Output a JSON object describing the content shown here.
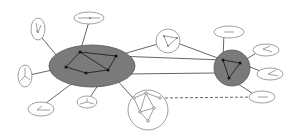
{
  "diagram": {
    "type": "hierarchical-cluster-network",
    "colors": {
      "background": "#ffffff",
      "cluster_fill": "#7a7a7a",
      "edge": "#555555",
      "node": "#111111",
      "subgraph_outline": "#888888",
      "subgraph_node": "#777777"
    },
    "clusters": [
      {
        "id": "big-cluster",
        "shape": "ellipse",
        "cx": 92,
        "cy": 67,
        "rx": 43,
        "ry": 21,
        "nodes": [
          [
            80,
            52
          ],
          [
            116,
            56
          ],
          [
            66,
            67
          ],
          [
            86,
            73
          ],
          [
            108,
            70
          ]
        ],
        "edges": [
          [
            0,
            1
          ],
          [
            0,
            2
          ],
          [
            2,
            3
          ],
          [
            3,
            4
          ],
          [
            1,
            4
          ],
          [
            0,
            4
          ]
        ]
      },
      {
        "id": "small-cluster",
        "shape": "circle",
        "cx": 232,
        "cy": 67,
        "rx": 18,
        "ry": 18,
        "nodes": [
          [
            223,
            60
          ],
          [
            240,
            63
          ],
          [
            229,
            78
          ]
        ],
        "edges": [
          [
            0,
            1
          ],
          [
            1,
            2
          ],
          [
            0,
            2
          ]
        ]
      }
    ],
    "satellites": [
      {
        "id": "sat-top-left",
        "cx": 38,
        "cy": 29,
        "rx": 7,
        "ry": 11,
        "attach": [
          80,
          52
        ]
      },
      {
        "id": "sat-top",
        "cx": 89,
        "cy": 18,
        "rx": 15,
        "ry": 6,
        "attach": [
          80,
          52
        ]
      },
      {
        "id": "sat-left",
        "cx": 25,
        "cy": 76,
        "rx": 7,
        "ry": 11,
        "attach": [
          66,
          67
        ]
      },
      {
        "id": "sat-bottom-left",
        "cx": 41,
        "cy": 109,
        "rx": 13,
        "ry": 7,
        "attach": [
          86,
          73
        ]
      },
      {
        "id": "sat-bottom",
        "cx": 87,
        "cy": 102,
        "rx": 10,
        "ry": 6,
        "attach": [
          108,
          70
        ]
      },
      {
        "id": "sat-top-center",
        "cx": 168,
        "cy": 41,
        "rx": 12,
        "ry": 12,
        "attach": null
      },
      {
        "id": "sat-right-top",
        "cx": 229,
        "cy": 32,
        "rx": 15,
        "ry": 6,
        "attach": [
          223,
          60
        ]
      },
      {
        "id": "sat-right-1",
        "cx": 266,
        "cy": 50,
        "rx": 13,
        "ry": 6,
        "attach": [
          240,
          63
        ]
      },
      {
        "id": "sat-right-2",
        "cx": 270,
        "cy": 74,
        "rx": 13,
        "ry": 6,
        "attach": [
          240,
          63
        ]
      },
      {
        "id": "sat-bottom-right",
        "cx": 262,
        "cy": 97,
        "rx": 13,
        "ry": 6,
        "attach": [
          229,
          78
        ]
      },
      {
        "id": "sat-bottom-center",
        "cx": 148,
        "cy": 110,
        "rx": 20,
        "ry": 20,
        "attach": [
          108,
          70
        ]
      }
    ],
    "inter_cluster_edges": [
      {
        "from": [
          116,
          56
        ],
        "to": [
          223,
          60
        ],
        "style": "solid"
      },
      {
        "from": [
          130,
          72
        ],
        "to": [
          215,
          72
        ],
        "style": "solid"
      },
      {
        "from": [
          116,
          56
        ],
        "to": [
          300,
          45
        ],
        "style": "solid"
      }
    ],
    "dashed_edges": [
      {
        "from": [
          160,
          98
        ],
        "to": [
          260,
          97
        ],
        "style": "dashed"
      }
    ]
  }
}
